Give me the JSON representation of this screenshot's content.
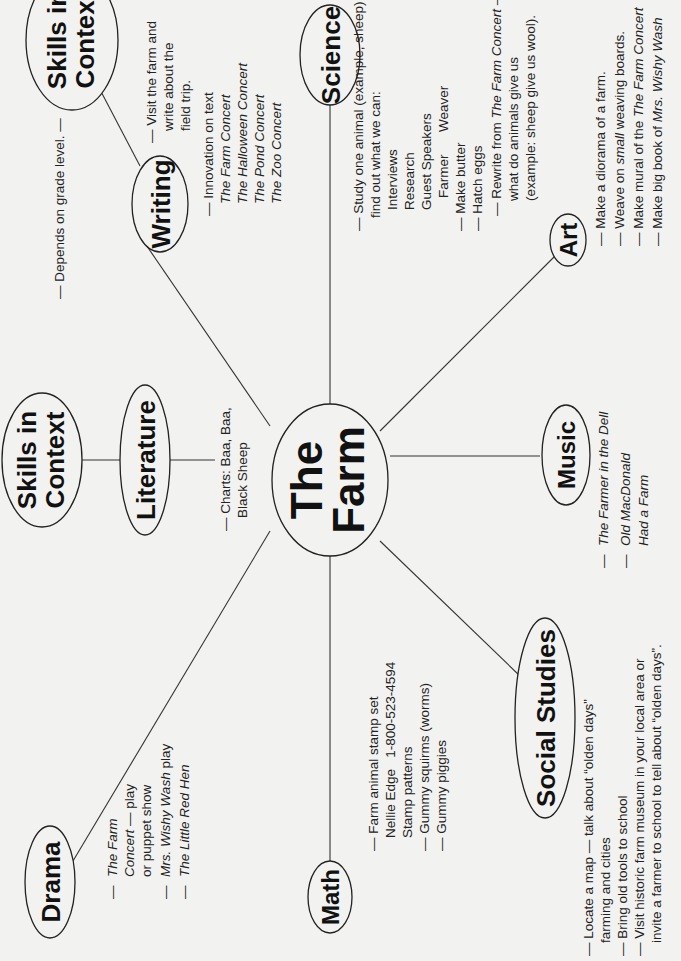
{
  "center": {
    "line1": "The",
    "line2": "Farm"
  },
  "nodes": {
    "skills_top": {
      "line1": "Skills in",
      "line2": "Context"
    },
    "skills_left": {
      "line1": "Skills in",
      "line2": "Context"
    },
    "writing": {
      "label": "Writing"
    },
    "science": {
      "label": "Science"
    },
    "art": {
      "label": "Art"
    },
    "music": {
      "label": "Music"
    },
    "social": {
      "label": "Social Studies"
    },
    "math": {
      "label": "Math"
    },
    "drama": {
      "label": "Drama"
    },
    "literature": {
      "label": "Literature"
    }
  },
  "notes": {
    "skills": "— Depends on grade level. —",
    "writing_visit": [
      "— Visit the farm and",
      "write about the",
      "field trip."
    ],
    "writing_innov": {
      "head": "— Innovation on text",
      "items": [
        "The Farm Concert",
        "The Halloween Concert",
        "The Pond Concert",
        "The Zoo Concert"
      ]
    },
    "science": [
      "— Study one animal (example, sheep) and",
      "find out what we can:",
      "Interviews",
      "Research",
      "Guest Speakers",
      "Farmer      Weaver",
      "— Make butter",
      "— Hatch eggs"
    ],
    "science_rewrite": {
      "pre": "— Rewrite from ",
      "title": "The Farm Concert",
      "post": " —",
      "l2": "what do animals give us",
      "l3": "(example: sheep give us wool)."
    },
    "art": {
      "a1": "— Make a diorama of a farm.",
      "a2_pre": "— Weave on ",
      "a2_it": "small",
      "a2_post": " weaving boards.",
      "a3_pre": "— Make mural of the ",
      "a3_it": "The Farm Concert",
      "a4_pre": "— Make big book of ",
      "a4_it": "Mrs. Wishy Wash"
    },
    "music": {
      "m1": "The Farmer in the Dell",
      "m2a": "Old MacDonald",
      "m2b": "Had a Farm",
      "dash": "—"
    },
    "literature": [
      "— Charts: Baa, Baa,",
      "Black Sheep"
    ],
    "math": [
      "— Farm animal stamp set",
      "Nellie Edge   1-800-523-4594",
      "Stamp patterns",
      "— Gummy squirms (worms)",
      "— Gummy piggies"
    ],
    "social": [
      "— Locate a map — talk about “olden days”",
      "farming and cities",
      "— Bring old tools to school",
      "— Visit historic farm museum in your local area or",
      "invite a farmer to school to tell about “olden days”."
    ],
    "drama": {
      "d1a": "The Farm",
      "d1b": "Concert",
      "d1c": " — play",
      "d1d": "or puppet show",
      "d2a": "Mrs. Wishy Wash",
      "d2b": " play",
      "d3": "The Little Red Hen",
      "dash": "—"
    }
  }
}
